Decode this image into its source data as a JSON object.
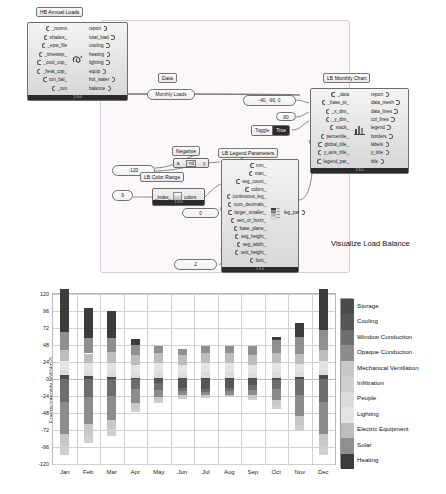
{
  "canvas": {
    "annotation": "Visualize Load Balance",
    "nodes": [
      {
        "id": "hb_annual_loads",
        "nickname": "HB Annual Loads",
        "status": "1.9.0",
        "inputs": [
          "_rooms",
          "shades_",
          "_epw_file",
          "_timestep_",
          "_cool_cop_",
          "_heat_cop_",
          "run_bal_",
          "_run"
        ],
        "outputs": [
          "report",
          "total_load",
          "cooling",
          "heating",
          "lighting",
          "equip",
          "hot_water",
          "balance"
        ]
      },
      {
        "id": "lb_monthly_chart",
        "nickname": "LB Monthly Chart",
        "status": "1.9.0",
        "inputs": [
          "_data",
          "_base_pt_",
          "_x_dim_",
          "_y_dim_",
          "stack_",
          "percentile_",
          "global_title_",
          "y_axis_title_",
          "legend_par_"
        ],
        "outputs": [
          "report",
          "data_mesh",
          "data_lines",
          "col_lines",
          "legend",
          "borders",
          "labels",
          "y_title",
          "title"
        ]
      },
      {
        "id": "lb_legend_parameters",
        "nickname": "LB Legend Parameters",
        "status": "1.9.0",
        "inputs": [
          "min_",
          "max_",
          "seg_count_",
          "colors_",
          "continuous_leg_",
          "num_decimals_",
          "larger_smaller_",
          "vert_or_horiz_",
          "base_plane_",
          "seg_height_",
          "seg_width_",
          "text_height_",
          "font_"
        ],
        "outputs": [
          "leg_par"
        ]
      },
      {
        "id": "lb_color_range",
        "nickname": "LB Color Range",
        "status": "1.9.0",
        "inputs": [
          "_index_"
        ],
        "outputs": [
          "colors"
        ]
      }
    ],
    "labels": {
      "data_param": "Data",
      "monthly_loads_param": "Monthly Loads",
      "negative_label": "Negative",
      "toggle_label": "Toggle",
      "toggle_value": "True"
    },
    "values": {
      "base_pt": "-40, -90, 0",
      "y_dim": "80",
      "min_value": "-120",
      "color_index": "9",
      "num_decimals": "0",
      "text_height": "2"
    },
    "expression": {
      "a": "a",
      "op": "<d",
      "b": "y"
    }
  },
  "chart_data": {
    "type": "bar",
    "stacked": true,
    "title": "",
    "xlabel": "",
    "ylabel": "Energy Intensity (kWh/m2)",
    "ylim": [
      -120,
      120
    ],
    "yticks": [
      120,
      96,
      72,
      48,
      24,
      0,
      -24,
      -48,
      -72,
      -96,
      -120
    ],
    "categories": [
      "Jan",
      "Feb",
      "Mar",
      "Apr",
      "May",
      "Jun",
      "Jul",
      "Aug",
      "Sep",
      "Oct",
      "Nov",
      "Dec"
    ],
    "grid": true,
    "legend_position": "right",
    "legend": [
      {
        "name": "Storage",
        "color": "#4b4b4b"
      },
      {
        "name": "Cooling",
        "color": "#565656"
      },
      {
        "name": "Window Conduction",
        "color": "#6e6e6e"
      },
      {
        "name": "Opaque Conduction",
        "color": "#8c8c8c"
      },
      {
        "name": "Mechanical Ventilation",
        "color": "#c8c8c8"
      },
      {
        "name": "Infiltration",
        "color": "#cfcfcf"
      },
      {
        "name": "People",
        "color": "#dcdcdc"
      },
      {
        "name": "Lighting",
        "color": "#e4e4e4"
      },
      {
        "name": "Electric Equipment",
        "color": "#bdbdbd"
      },
      {
        "name": "Solar",
        "color": "#8f8f8f"
      },
      {
        "name": "Heating",
        "color": "#3c3c3c"
      }
    ],
    "series": [
      {
        "name": "Storage",
        "color": "#4b4b4b",
        "values": [
          5,
          4,
          3,
          2,
          2,
          2,
          2,
          2,
          2,
          2,
          3,
          5
        ]
      },
      {
        "name": "Cooling",
        "color": "#565656",
        "values": [
          0,
          0,
          0,
          0,
          -6,
          -12,
          -14,
          -13,
          -9,
          -2,
          0,
          0
        ]
      },
      {
        "name": "Window Conduction",
        "color": "#6e6e6e",
        "values": [
          -32,
          -26,
          -24,
          -14,
          -9,
          -5,
          -4,
          -4,
          -6,
          -12,
          -22,
          -32
        ]
      },
      {
        "name": "Opaque Conduction",
        "color": "#8c8c8c",
        "values": [
          -45,
          -38,
          -34,
          -20,
          -11,
          -6,
          -5,
          -5,
          -8,
          -16,
          -30,
          -45
        ]
      },
      {
        "name": "Mechanical Ventilation",
        "color": "#c8c8c8",
        "values": [
          -18,
          -15,
          -13,
          -8,
          -5,
          -3,
          -2,
          -2,
          -4,
          -7,
          -13,
          -18
        ]
      },
      {
        "name": "Infiltration",
        "color": "#cfcfcf",
        "values": [
          -13,
          -11,
          -9,
          -5,
          -3,
          -2,
          -2,
          -2,
          -3,
          -5,
          -9,
          -13
        ]
      },
      {
        "name": "People",
        "color": "#dcdcdc",
        "values": [
          8,
          7,
          8,
          7,
          8,
          7,
          8,
          8,
          7,
          8,
          7,
          8
        ]
      },
      {
        "name": "Lighting",
        "color": "#e4e4e4",
        "values": [
          12,
          11,
          12,
          11,
          12,
          11,
          12,
          12,
          11,
          12,
          11,
          12
        ]
      },
      {
        "name": "Electric Equipment",
        "color": "#bdbdbd",
        "values": [
          16,
          14,
          15,
          14,
          15,
          14,
          15,
          15,
          14,
          15,
          14,
          16
        ]
      },
      {
        "name": "Solar",
        "color": "#8f8f8f",
        "values": [
          26,
          22,
          20,
          14,
          10,
          9,
          9,
          10,
          13,
          18,
          24,
          28
        ]
      },
      {
        "name": "Heating",
        "color": "#3c3c3c",
        "values": [
          60,
          42,
          38,
          8,
          0,
          0,
          0,
          0,
          0,
          5,
          20,
          58
        ]
      }
    ]
  }
}
